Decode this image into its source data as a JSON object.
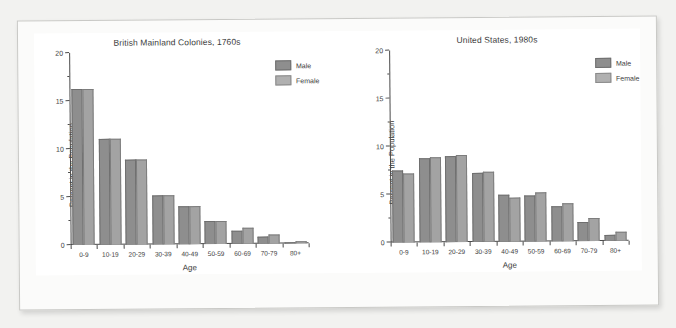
{
  "chart_data": [
    {
      "type": "bar",
      "title": "British Mainland Colonies, 1760s",
      "xlabel": "Age",
      "ylabel": "Percent in the Population",
      "ylim": [
        0,
        20
      ],
      "yticks": [
        0,
        5,
        10,
        15,
        20
      ],
      "ytick_labels": [
        "0",
        "5",
        "10",
        "15",
        "20"
      ],
      "grid": false,
      "legend_position": "top-right",
      "categories": [
        "0-9",
        "10-19",
        "20-29",
        "30-39",
        "40-49",
        "50-59",
        "60-69",
        "70-79",
        "80+"
      ],
      "series": [
        {
          "name": "Male",
          "values": [
            16.2,
            11.0,
            8.9,
            5.1,
            4.0,
            2.4,
            1.4,
            0.7,
            0.1
          ]
        },
        {
          "name": "Female",
          "values": [
            16.2,
            11.0,
            8.9,
            5.1,
            4.0,
            2.4,
            1.7,
            0.9,
            0.2
          ]
        }
      ]
    },
    {
      "type": "bar",
      "title": "United States, 1980s",
      "xlabel": "Age",
      "ylabel": "Percent in the Population",
      "ylim": [
        0,
        20
      ],
      "yticks": [
        0,
        5,
        10,
        15,
        20
      ],
      "ytick_labels": [
        "0",
        "5",
        "10",
        "15",
        "20"
      ],
      "grid": false,
      "legend_position": "top-right",
      "categories": [
        "0-9",
        "10-19",
        "20-29",
        "30-39",
        "40-49",
        "50-59",
        "60-69",
        "70-79",
        "80+"
      ],
      "series": [
        {
          "name": "Male",
          "values": [
            7.5,
            8.8,
            9.0,
            7.2,
            4.9,
            4.8,
            3.6,
            2.0,
            0.6
          ]
        },
        {
          "name": "Female",
          "values": [
            7.2,
            8.9,
            9.1,
            7.3,
            4.6,
            5.1,
            4.0,
            2.4,
            0.9
          ]
        }
      ]
    }
  ],
  "legend": {
    "male_label": "Male",
    "female_label": "Female"
  },
  "colors": {
    "male_bar": "#8e8e8e",
    "female_bar": "#a3a3a3",
    "axis": "#4a4a4a",
    "text": "#3b3b3b",
    "paper": "#fbfbfa",
    "background": "#f2f2f0"
  }
}
